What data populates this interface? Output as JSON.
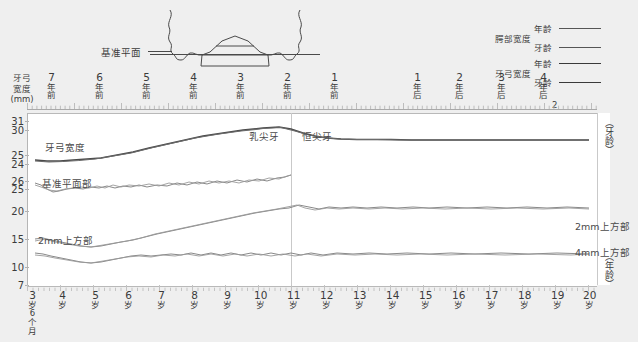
{
  "figure": {
    "title_left_axis": "牙弓宽度（mm）",
    "axis_left_lines": [
      "牙弓",
      "宽度",
      "(mm)"
    ],
    "baseline_label": "基准平面",
    "right_top_label": "（牙龄）",
    "right_bottom_label": "（年龄）"
  },
  "legend": {
    "groups": [
      {
        "category": "腭部宽度",
        "rows": [
          {
            "label": "年龄",
            "style": "thin"
          },
          {
            "label": "牙龄",
            "style": "thin"
          }
        ]
      },
      {
        "category": "牙弓宽度",
        "rows": [
          {
            "label": "年龄",
            "style": "thick"
          },
          {
            "label": "牙龄",
            "style": "thick"
          }
        ]
      }
    ]
  },
  "annotations": {
    "deciduous_canine": "乳尖牙",
    "permanent_canine": "恒尖牙",
    "curve_arch_width": "牙弓宽度",
    "curve_baseline_part": "基准平面部",
    "curve_2mm_left": "2mm上方部",
    "curve_2mm_right": "2mm上方部",
    "curve_4mm_right": "4mm上方部"
  },
  "chart_data": {
    "type": "line",
    "xlabel": "（年龄）",
    "ylabel": "牙弓宽度（mm）",
    "grid": false,
    "legend_position": "top-right",
    "top_axis": {
      "name": "牙龄",
      "ticks": [
        "7年前",
        "6年前",
        "5年前",
        "4年前",
        "3年前",
        "2年前",
        "1年前",
        "1年后",
        "2年后",
        "3年后",
        "4年后"
      ],
      "suffix_after_last": "2"
    },
    "bottom_axis": {
      "name": "年龄",
      "ticks": [
        "3岁6个月",
        "4岁",
        "5岁",
        "6岁",
        "7岁",
        "8岁",
        "9岁",
        "10岁",
        "11岁",
        "12岁",
        "13岁",
        "14岁",
        "15岁",
        "16岁",
        "17岁",
        "18岁",
        "19岁",
        "20岁"
      ]
    },
    "y_ticks": [
      31,
      30,
      25,
      24,
      26,
      25,
      20,
      15,
      10,
      7
    ],
    "ylim": [
      7,
      31
    ],
    "series": [
      {
        "name": "牙弓宽度 年龄",
        "style": "thick",
        "x": [
          3.5,
          4,
          4.5,
          5,
          5.5,
          6,
          6.5,
          7,
          7.5,
          8,
          8.5,
          9,
          9.5,
          10,
          10.5,
          11,
          11.5,
          12,
          12.5,
          13,
          13.5,
          14,
          15,
          16,
          17,
          18,
          19,
          20
        ],
        "values": [
          25.3,
          25.2,
          25.2,
          25.3,
          25.5,
          25.6,
          25.9,
          26.2,
          26.6,
          27.1,
          27.6,
          28.1,
          28.6,
          29.0,
          29.4,
          29.2,
          28.6,
          28.3,
          28.2,
          28.1,
          28.1,
          28.1,
          28.0,
          28.0,
          28.0,
          28.0,
          28.0,
          28.0
        ]
      },
      {
        "name": "牙弓宽度 牙龄",
        "style": "thick",
        "x": [
          3.5,
          4,
          5,
          6,
          7,
          8,
          9,
          10,
          11,
          12,
          13,
          14,
          15,
          16,
          17,
          18,
          19,
          20
        ],
        "values": [
          25.2,
          25.2,
          25.3,
          25.6,
          26.2,
          27.1,
          28.1,
          29.0,
          29.2,
          28.4,
          28.2,
          28.1,
          28.0,
          28.0,
          28.0,
          28.0,
          28.0,
          28.0
        ]
      },
      {
        "name": "腭部宽度 基准平面部 年龄",
        "style": "thin",
        "x": [
          3.5,
          4,
          4.5,
          5,
          5.5,
          6,
          6.5,
          7,
          7.5,
          8,
          8.5,
          9,
          9.5,
          10,
          10.5,
          11
        ],
        "values": [
          24.0,
          23.4,
          23.0,
          23.3,
          23.4,
          23.5,
          23.6,
          23.5,
          23.9,
          23.6,
          24.1,
          23.8,
          24.3,
          24.4,
          24.6,
          25.2
        ]
      },
      {
        "name": "腭部宽度 基准平面部 牙龄",
        "style": "thin",
        "x": [
          3.5,
          4,
          4.5,
          5,
          5.5,
          6,
          6.5,
          7,
          7.5,
          8,
          8.5,
          9,
          9.5,
          10,
          10.5,
          11
        ],
        "values": [
          23.8,
          23.2,
          23.2,
          23.4,
          23.5,
          23.5,
          23.8,
          23.6,
          23.7,
          24.0,
          23.8,
          24.2,
          24.0,
          24.5,
          24.8,
          25.1
        ]
      },
      {
        "name": "腭部宽度 2mm上方部 年龄",
        "style": "thin",
        "x": [
          3.5,
          4,
          4.5,
          5,
          5.5,
          6,
          6.5,
          7,
          7.5,
          8,
          8.5,
          9,
          9.5,
          10,
          10.5,
          11,
          11.5,
          12,
          12.5,
          13,
          13.5,
          14,
          14.5,
          15,
          16,
          17,
          18,
          19,
          20
        ],
        "values": [
          11.4,
          11.5,
          11.3,
          11.1,
          10.8,
          10.6,
          10.4,
          10.5,
          10.7,
          11.0,
          11.4,
          11.8,
          12.2,
          12.6,
          13.0,
          13.5,
          14.0,
          14.4,
          14.8,
          15.2,
          15.6,
          16.0,
          16.3,
          16.6,
          16.6,
          16.5,
          16.6,
          16.6,
          16.5
        ]
      },
      {
        "name": "腭部宽度 2mm上方部 牙龄",
        "style": "thin",
        "x": [
          3.5,
          4,
          5,
          6,
          7,
          8,
          9,
          10,
          11,
          12,
          13,
          14,
          15,
          16,
          17,
          18,
          19,
          20
        ],
        "values": [
          11.2,
          11.4,
          11.0,
          10.5,
          10.6,
          11.1,
          11.9,
          12.7,
          13.5,
          14.3,
          15.1,
          15.9,
          16.6,
          16.5,
          16.5,
          16.6,
          16.5,
          16.5
        ]
      },
      {
        "name": "腭部宽度 4mm上方部 年龄",
        "style": "thin",
        "x": [
          3.5,
          4,
          4.5,
          5,
          5.5,
          6,
          6.5,
          7,
          7.5,
          8,
          8.5,
          9,
          9.5,
          10,
          10.5,
          11,
          11.5,
          12,
          12.5,
          13,
          13.5,
          14,
          14.5,
          15,
          16,
          17,
          18,
          19,
          20
        ],
        "values": [
          10.2,
          10.0,
          9.9,
          9.5,
          9.2,
          9.0,
          8.9,
          9.0,
          9.3,
          9.6,
          9.9,
          10.0,
          9.9,
          10.0,
          10.3,
          10.1,
          10.4,
          10.2,
          10.5,
          10.3,
          10.6,
          10.4,
          10.7,
          10.6,
          10.7,
          10.7,
          10.6,
          10.6,
          10.5
        ]
      },
      {
        "name": "腭部宽度 4mm上方部 牙龄",
        "style": "thin",
        "x": [
          3.5,
          4,
          5,
          6,
          7,
          8,
          9,
          10,
          11,
          12,
          13,
          14,
          15,
          16,
          17,
          18,
          19,
          20
        ],
        "values": [
          10.0,
          9.9,
          9.3,
          9.0,
          9.2,
          9.7,
          10.0,
          10.1,
          10.2,
          10.4,
          10.4,
          10.5,
          10.6,
          10.7,
          10.6,
          10.6,
          10.6,
          10.5
        ]
      }
    ]
  }
}
